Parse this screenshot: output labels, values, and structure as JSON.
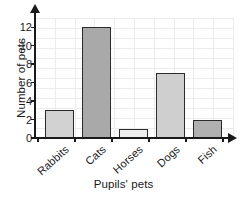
{
  "chart_data": {
    "type": "bar",
    "title": "",
    "categories": [
      "Rabbits",
      "Cats",
      "Horses",
      "Dogs",
      "Fish"
    ],
    "values": [
      3,
      12,
      1,
      7,
      2
    ],
    "series": [
      {
        "name": "Number of pets",
        "values": [
          3,
          12,
          1,
          7,
          2
        ]
      }
    ],
    "xlabel": "Pupils' pets",
    "ylabel": "Number of pets",
    "ylim": [
      0,
      13
    ],
    "yticks": [
      0,
      2,
      4,
      6,
      8,
      10,
      12
    ],
    "ytick_labels": [
      "0",
      "2",
      "4",
      "6",
      "8",
      "10",
      "12"
    ],
    "grid": true,
    "legend": false,
    "bar_colors": [
      "#d2d2d2",
      "#a9a9a9",
      "#ededed",
      "#cfcfcf",
      "#b0b0b0"
    ],
    "bar_border_color": "#2b2b2b",
    "axis_color": "#1a1a1a",
    "grid_color": "#ececec",
    "background_color": "#ffffff",
    "x_label_rotation_deg": -42
  },
  "axes": {
    "y_title": "Number of pets",
    "x_title": "Pupils' pets",
    "y_tick_labels": [
      "12",
      "10",
      "8",
      "6",
      "4",
      "2",
      "0"
    ],
    "x_tick_labels": [
      "Rabbits",
      "Cats",
      "Horses",
      "Dogs",
      "Fish"
    ],
    "y_arrow_icon": "arrow-up-icon",
    "x_arrow_icon": "arrow-right-icon"
  }
}
